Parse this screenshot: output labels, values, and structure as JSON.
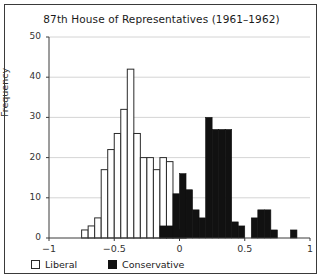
{
  "chart_data": {
    "type": "bar",
    "title": "87th House of Representatives (1961–1962)",
    "xlabel": "",
    "ylabel": "Frequency",
    "xlim": [
      -1,
      1
    ],
    "ylim": [
      0,
      50
    ],
    "yticks": [
      0,
      10,
      20,
      30,
      40,
      50
    ],
    "xticks": [
      -1,
      -0.5,
      0,
      0.5,
      1
    ],
    "xtick_labels": [
      "−1",
      "−0.5",
      "0",
      "0.5",
      "1"
    ],
    "ytick_labels": [
      "0",
      "10",
      "20",
      "30",
      "40",
      "50"
    ],
    "grid": "horizontal",
    "bin_width": 0.05,
    "legend_position": "below-axes",
    "colors": {
      "liberal": "#ffffff",
      "liberal_edge": "#2a2a2a",
      "conservative": "#111111",
      "grid": "#c9c9c9",
      "axis": "#3a3a3a"
    },
    "series": [
      {
        "name": "Liberal",
        "bins": [
          -0.75,
          -0.7,
          -0.65,
          -0.6,
          -0.55,
          -0.5,
          -0.45,
          -0.4,
          -0.35,
          -0.3,
          -0.25,
          -0.2,
          -0.15,
          -0.1,
          -0.05,
          0.0,
          0.05,
          0.1
        ],
        "values": [
          2,
          3,
          5,
          17,
          22,
          26,
          32,
          42,
          26,
          20,
          20,
          17,
          20,
          19,
          2,
          2,
          0,
          0
        ]
      },
      {
        "name": "Conservative",
        "bins": [
          -0.15,
          -0.1,
          -0.05,
          0.0,
          0.05,
          0.1,
          0.15,
          0.2,
          0.25,
          0.3,
          0.35,
          0.4,
          0.45,
          0.5,
          0.55,
          0.6,
          0.65,
          0.7,
          0.75,
          0.8,
          0.85,
          0.9
        ],
        "values": [
          3,
          3,
          11,
          16,
          12,
          7,
          5,
          30,
          27,
          27,
          27,
          4,
          3,
          0,
          5,
          7,
          7,
          2,
          0,
          0,
          2,
          0
        ]
      }
    ]
  },
  "legend": {
    "items": [
      {
        "label": "Liberal",
        "swatch": "liberal-swatch"
      },
      {
        "label": "Conservative",
        "swatch": "conservative-swatch"
      }
    ]
  }
}
